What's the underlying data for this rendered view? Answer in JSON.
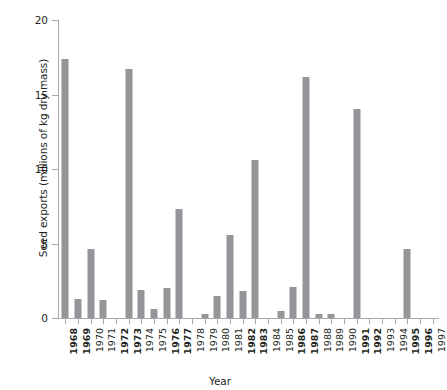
{
  "chart_data": {
    "type": "bar",
    "title": "",
    "xlabel": "Year",
    "ylabel": "Seed exports (millions of kg dry mass)",
    "ylim": [
      0,
      20
    ],
    "yticks": [
      0,
      5,
      10,
      15,
      20
    ],
    "ytick_labels": [
      "0",
      "5",
      "10",
      "15",
      "20"
    ],
    "grid": false,
    "legend": null,
    "bar_color": "#939598",
    "axis_color": "#a7a9ac",
    "categories": [
      "1968",
      "1969",
      "1970",
      "1971",
      "1972",
      "1973",
      "1974",
      "1975",
      "1976",
      "1977",
      "1978",
      "1979",
      "1980",
      "1981",
      "1982",
      "1983",
      "1984",
      "1985",
      "1986",
      "1987",
      "1988",
      "1989",
      "1990",
      "1991",
      "1992",
      "1993",
      "1994",
      "1995",
      "1996",
      "1997"
    ],
    "values": [
      17.4,
      1.3,
      4.6,
      1.2,
      0,
      16.7,
      1.9,
      0.6,
      2.0,
      7.3,
      0,
      0.3,
      1.5,
      5.6,
      1.8,
      10.6,
      0,
      0.5,
      2.1,
      16.2,
      0.3,
      0.25,
      0,
      14.0,
      0,
      0,
      0,
      4.6,
      0,
      0
    ],
    "bold_categories": [
      "1968",
      "1969",
      "1972",
      "1973",
      "1976",
      "1977",
      "1982",
      "1983",
      "1986",
      "1987",
      "1991",
      "1992",
      "1995",
      "1996"
    ]
  }
}
